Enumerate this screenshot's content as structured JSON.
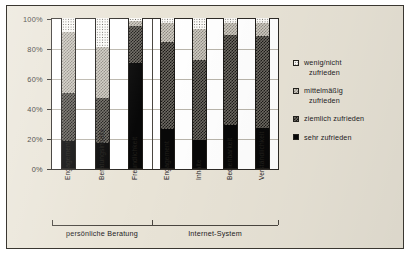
{
  "chart_data": {
    "type": "bar",
    "subtype": "stacked-percentage-column",
    "title": "",
    "xlabel": "",
    "ylabel": "",
    "ylim": [
      0,
      100
    ],
    "ytick_labels": [
      "0%",
      "20%",
      "40%",
      "60%",
      "80%",
      "100%"
    ],
    "ytick_values": [
      0,
      20,
      40,
      60,
      80,
      100
    ],
    "grid": true,
    "legend_position": "right",
    "group_labels": [
      "persönliche Beratung",
      "Internet-System"
    ],
    "groups": [
      {
        "label": "persönliche Beratung",
        "categories": [
          "Engagement",
          "Beratungsinhalte",
          "Freundlichkeit"
        ]
      },
      {
        "label": "Internet-System",
        "categories": [
          "Engagement",
          "Inhalte",
          "Bedienbarkeit",
          "Verständlichkeit"
        ]
      }
    ],
    "categories": [
      "Engagement",
      "Beratungsinhalte",
      "Freundlichkeit",
      "Engagement",
      "Inhalte",
      "Bedienbarkeit",
      "Verständlichkeit"
    ],
    "series": [
      {
        "name": "sehr zufrieden",
        "values": [
          18,
          17,
          70,
          26,
          19,
          29,
          27
        ]
      },
      {
        "name": "ziemlich zufrieden",
        "values": [
          32,
          30,
          25,
          58,
          53,
          60,
          61
        ]
      },
      {
        "name": "mittelmäßig zufrieden",
        "values": [
          41,
          34,
          3,
          13,
          21,
          8,
          9
        ]
      },
      {
        "name": "wenig/nicht zufrieden",
        "values": [
          9,
          19,
          2,
          3,
          7,
          3,
          3
        ]
      }
    ],
    "legend": [
      {
        "label_line1": "wenig/nicht",
        "label_line2": "zufrieden",
        "swatch": "white-dotted"
      },
      {
        "label_line1": "mittelmäßig",
        "label_line2": "zufrieden",
        "swatch": "light-grey-hatch"
      },
      {
        "label_line1": "ziemlich zufrieden",
        "label_line2": "",
        "swatch": "dark-checkered"
      },
      {
        "label_line1": "sehr zufrieden",
        "label_line2": "",
        "swatch": "solid-black"
      }
    ],
    "colors": {
      "sehr_zufrieden": "#080808",
      "ziemlich_zufrieden": "#6e6a63",
      "mittelmaessig_zufrieden": "#cfcbc2",
      "wenig_nicht_zufrieden": "#fbfaf7",
      "page_background": "#e9e4d7",
      "plot_background": "#ffffff",
      "frame": "#3a3731",
      "gridline": "#b9b5ab"
    }
  }
}
